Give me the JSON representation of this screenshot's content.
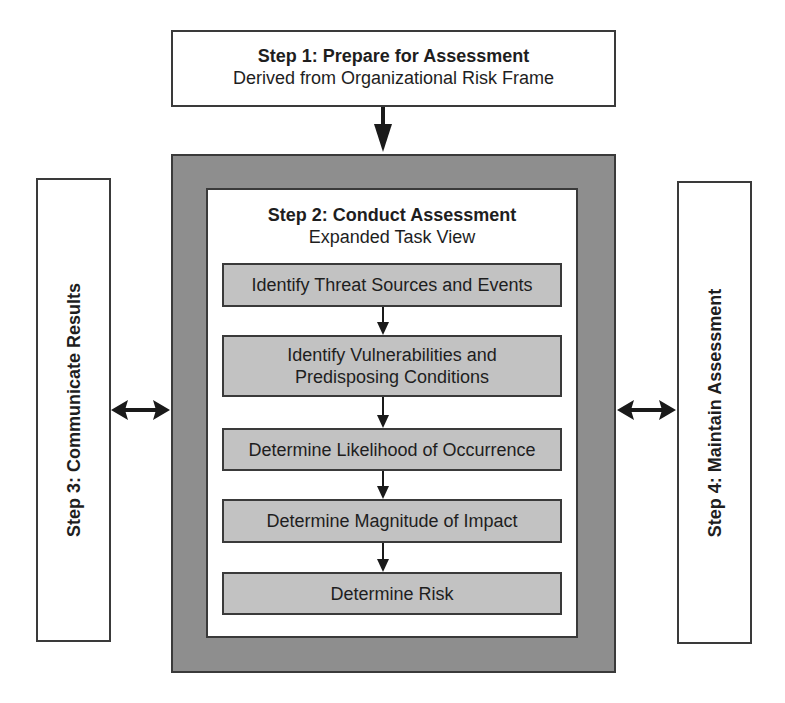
{
  "step1": {
    "title": "Step 1: Prepare for Assessment",
    "subtitle": "Derived from Organizational Risk Frame"
  },
  "step2": {
    "title": "Step 2: Conduct Assessment",
    "subtitle": "Expanded Task View",
    "tasks": [
      {
        "label": "Identify Threat Sources and Events"
      },
      {
        "label": "Identify Vulnerabilities and\nPredisposing Conditions"
      },
      {
        "label": "Determine Likelihood of Occurrence"
      },
      {
        "label": "Determine Magnitude of Impact"
      },
      {
        "label": "Determine Risk"
      }
    ]
  },
  "step3": {
    "label": "Step 3: Communicate Results"
  },
  "step4": {
    "label": "Step 4: Maintain Assessment"
  },
  "colors": {
    "outer_fill": "#8e8e8e",
    "task_fill": "#c2c2c2",
    "border": "#3a3a3a",
    "arrow": "#1a1a1a"
  }
}
